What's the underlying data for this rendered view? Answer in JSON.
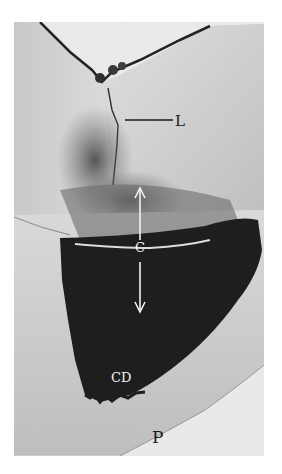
{
  "figure": {
    "labels": {
      "L": "L",
      "C": "C",
      "CD": "CD",
      "P": "P"
    },
    "colors": {
      "background": "#ffffff",
      "tissue_light": "#d9d9d9",
      "tissue_mid": "#9a9a9a",
      "dark_region": "#161616",
      "label_dark": "#1a1a1a",
      "label_light": "#f2f2f2"
    }
  }
}
